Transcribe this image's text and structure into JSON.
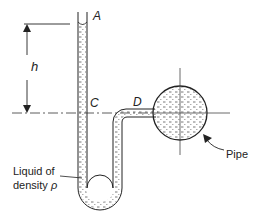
{
  "diagram": {
    "type": "U-tube manometer connected to pipe",
    "labels": {
      "point_a": "A",
      "point_c": "C",
      "point_d": "D",
      "height": "h",
      "pipe": "Pipe",
      "liquid_line1": "Liquid of",
      "liquid_line2": "density ",
      "density_symbol": "ρ"
    },
    "colors": {
      "stroke": "#222222",
      "liquid_dash": "#555555",
      "background": "#ffffff"
    }
  }
}
